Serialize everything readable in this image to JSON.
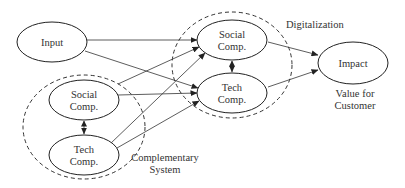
{
  "diagram": {
    "nodes": {
      "input": {
        "label": "Input"
      },
      "cs_social": {
        "line1": "Social",
        "line2": "Comp."
      },
      "cs_tech": {
        "line1": "Tech",
        "line2": "Comp."
      },
      "dg_social": {
        "line1": "Social",
        "line2": "Comp."
      },
      "dg_tech": {
        "line1": "Tech",
        "line2": "Comp."
      },
      "impact": {
        "label": "Impact"
      }
    },
    "groups": {
      "digitalization": {
        "label": "Digitalization"
      },
      "complementary": {
        "line1": "Complementary",
        "line2": "System"
      }
    },
    "annotations": {
      "value": {
        "line1": "Value for",
        "line2": "Customer"
      }
    },
    "edges": [
      {
        "from": "Input",
        "to": "Digitalization Social Comp."
      },
      {
        "from": "Input",
        "to": "Digitalization Tech Comp."
      },
      {
        "from": "Complementary Social Comp.",
        "to": "Digitalization Social Comp."
      },
      {
        "from": "Complementary Social Comp.",
        "to": "Digitalization Tech Comp."
      },
      {
        "from": "Complementary Tech Comp.",
        "to": "Digitalization Social Comp."
      },
      {
        "from": "Complementary Tech Comp.",
        "to": "Digitalization Tech Comp."
      },
      {
        "from": "Digitalization Social Comp.",
        "to": "Impact"
      },
      {
        "from": "Digitalization Tech Comp.",
        "to": "Impact"
      },
      {
        "from": "Complementary Social Comp.",
        "to": "Complementary Tech Comp.",
        "bidirectional": true
      },
      {
        "from": "Digitalization Social Comp.",
        "to": "Digitalization Tech Comp.",
        "bidirectional": true
      }
    ]
  }
}
